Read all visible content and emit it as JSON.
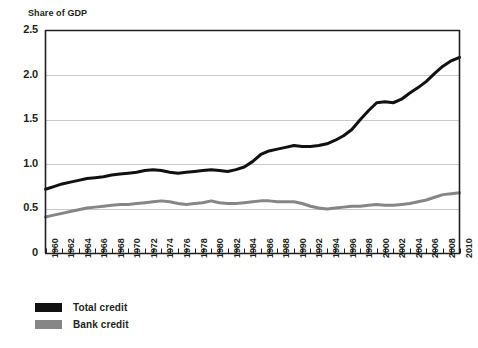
{
  "chart_data": {
    "type": "line",
    "title": "",
    "ylabel": "Share of GDP",
    "xlabel": "",
    "ylim": [
      0,
      2.5
    ],
    "xlim": [
      1960,
      2010
    ],
    "yticks": [
      "0",
      "0.5",
      "1.0",
      "1.5",
      "2.0",
      "2.5"
    ],
    "ytick_values": [
      0,
      0.5,
      1.0,
      1.5,
      2.0,
      2.5
    ],
    "grid": "horizontal",
    "legend_position": "below-left",
    "x": [
      1960,
      1961,
      1962,
      1963,
      1964,
      1965,
      1966,
      1967,
      1968,
      1969,
      1970,
      1971,
      1972,
      1973,
      1974,
      1975,
      1976,
      1977,
      1978,
      1979,
      1980,
      1981,
      1982,
      1983,
      1984,
      1985,
      1986,
      1987,
      1988,
      1989,
      1990,
      1991,
      1992,
      1993,
      1994,
      1995,
      1996,
      1997,
      1998,
      1999,
      2000,
      2001,
      2002,
      2003,
      2004,
      2005,
      2006,
      2007,
      2008,
      2009,
      2010
    ],
    "xtick_labels": [
      "1960",
      "1962",
      "1964",
      "1966",
      "1968",
      "1970",
      "1972",
      "1974",
      "1976",
      "1978",
      "1980",
      "1982",
      "1984",
      "1986",
      "1988",
      "1990",
      "1992",
      "1994",
      "1996",
      "1998",
      "2000",
      "2002",
      "2004",
      "2006",
      "2008",
      "2010"
    ],
    "series": [
      {
        "name": "Total credit",
        "color": "#111111",
        "values": [
          0.72,
          0.75,
          0.78,
          0.8,
          0.82,
          0.84,
          0.85,
          0.86,
          0.88,
          0.89,
          0.9,
          0.91,
          0.93,
          0.94,
          0.93,
          0.91,
          0.9,
          0.91,
          0.92,
          0.93,
          0.94,
          0.93,
          0.92,
          0.94,
          0.97,
          1.03,
          1.11,
          1.15,
          1.17,
          1.19,
          1.21,
          1.2,
          1.2,
          1.21,
          1.23,
          1.27,
          1.32,
          1.39,
          1.5,
          1.6,
          1.69,
          1.7,
          1.69,
          1.73,
          1.8,
          1.86,
          1.93,
          2.02,
          2.1,
          2.16,
          2.2
        ]
      },
      {
        "name": "Bank credit",
        "color": "#868686",
        "values": [
          0.41,
          0.43,
          0.45,
          0.47,
          0.49,
          0.51,
          0.52,
          0.53,
          0.54,
          0.55,
          0.55,
          0.56,
          0.57,
          0.58,
          0.59,
          0.58,
          0.56,
          0.55,
          0.56,
          0.57,
          0.59,
          0.57,
          0.56,
          0.56,
          0.57,
          0.58,
          0.59,
          0.59,
          0.58,
          0.58,
          0.58,
          0.56,
          0.53,
          0.51,
          0.5,
          0.51,
          0.52,
          0.53,
          0.53,
          0.54,
          0.55,
          0.54,
          0.54,
          0.55,
          0.56,
          0.58,
          0.6,
          0.63,
          0.66,
          0.67,
          0.68
        ]
      }
    ]
  },
  "legend": {
    "items": [
      {
        "label": "Total credit",
        "color": "#111111"
      },
      {
        "label": "Bank credit",
        "color": "#868686"
      }
    ]
  }
}
